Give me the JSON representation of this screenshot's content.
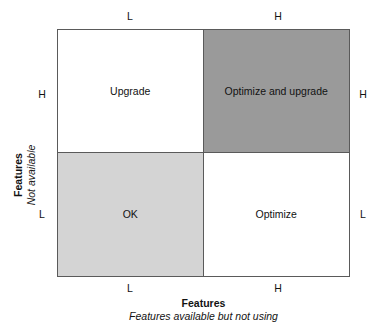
{
  "figure": {
    "type": "2x2-matrix",
    "quadrants": {
      "top_left": {
        "label": "Upgrade",
        "fill": "#ffffff"
      },
      "top_right": {
        "label": "Optimize and upgrade",
        "fill": "#9a9a9a"
      },
      "bottom_left": {
        "label": "OK",
        "fill": "#d4d4d4"
      },
      "bottom_right": {
        "label": "Optimize",
        "fill": "#ffffff"
      }
    },
    "axes": {
      "x": {
        "title": "Features",
        "subtitle": "Features available but not using",
        "ticks_bottom": {
          "left": "L",
          "right": "H"
        },
        "ticks_top": {
          "left": "L",
          "right": "H"
        }
      },
      "y": {
        "title": "Features",
        "subtitle": "Not available",
        "ticks_left": {
          "top": "H",
          "bottom": "L"
        },
        "ticks_right": {
          "top": "H",
          "bottom": "L"
        }
      }
    },
    "colors": {
      "border": "#5a5a5a",
      "dark_fill": "#9a9a9a",
      "light_fill": "#d4d4d4",
      "white_fill": "#ffffff",
      "text": "#121212"
    }
  }
}
